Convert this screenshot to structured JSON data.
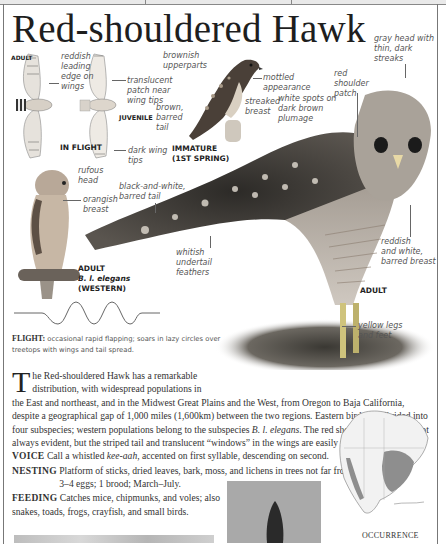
{
  "page": {
    "title": "Red-shouldered Hawk"
  },
  "illustrations": {
    "in_flight": {
      "adult_tag": "ADULT",
      "juvenile_tag": "JUVENILE",
      "caption": "IN FLIGHT",
      "labels": {
        "reddish_edge": "reddish\nleading\nedge on\nwings",
        "translucent_patch": "translucent\npatch near\nwing tips",
        "dark_tips": "dark wing\ntips"
      }
    },
    "immature": {
      "caption": "IMMATURE\n(1ST SPRING)",
      "labels": {
        "upperparts": "brownish\nupperparts",
        "mottled": "mottled\nappearance",
        "streaked": "streaked\nbreast",
        "tail": "brown,\nbarred\ntail"
      }
    },
    "western_adult": {
      "caption_line1": "ADULT",
      "caption_line2": "B. l. elegans",
      "caption_line3": "(WESTERN)",
      "labels": {
        "head": "rufous\nhead",
        "breast": "orangish\nbreast"
      }
    },
    "adult": {
      "caption": "ADULT",
      "labels": {
        "gray_head": "gray head with\nthin, dark\nstreaks",
        "red_patch": "red\nshoulder\npatch",
        "white_spots": "white spots on\ndark brown\nplumage",
        "barred_tail": "black-and-white,\nbarred tail",
        "undertail": "whitish\nundertail\nfeathers",
        "barred_breast": "reddish\nand white,\nbarred breast",
        "legs": "yellow legs\nand feet"
      }
    }
  },
  "flight": {
    "heading": "FLIGHT:",
    "text": "occasional rapid flapping; soars in lazy circles over treetops with wings and tail spread."
  },
  "description": {
    "drop_cap": "T",
    "intro_1": "he Red-shouldered Hawk has a remarkable",
    "intro_2": "distribution, with widespread populations in",
    "body": "the East and northeast, and in the Midwest Great Plains and the West, from Oregon to Baja California, despite a geographical gap of 1,000 miles (1,600km) between the two regions. Eastern birds are divided into four subspecies; western populations belong to the subspecies ",
    "subspecies": "B. l. elegans",
    "body_end": ". The red shoulder patches are not always evident, but the striped tail and translucent “windows” in the wings are easily identifiable."
  },
  "facts": {
    "voice": {
      "heading": "VOICE",
      "text_pre": "Call a whistled ",
      "call": "kee-aah",
      "text_post": ", accented on first syllable, descending on second."
    },
    "nesting": {
      "heading": "NESTING",
      "text": "Platform of sticks, dried leaves, bark, moss, and lichens in trees not far from water; 3–4 eggs; 1 brood; March–July."
    },
    "feeding": {
      "heading": "FEEDING",
      "text_1": "Catches mice, chipmunks, and voles; also",
      "text_2": "snakes, toads, frogs, crayfish, and small birds."
    }
  },
  "map": {
    "heading": "OCCURRENCE"
  }
}
